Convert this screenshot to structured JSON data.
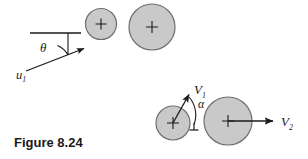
{
  "figure": {
    "caption": "Figure 8.24",
    "caption_position": {
      "x": 14,
      "y": 146
    },
    "background_color": "#ffffff",
    "stroke_color": "#1a1a1a",
    "body_fill_color": "#c9c9c9",
    "body_stroke_color": "#707070"
  },
  "diagrams": [
    {
      "id": "before-impact",
      "name": "before-impact-diagram",
      "bodies": [
        {
          "id": "small-ball-before",
          "name": "small-ball-before",
          "cx": 101,
          "cy": 24,
          "r": 15,
          "center_marker": "plus"
        },
        {
          "id": "large-ball-before",
          "name": "large-ball-before",
          "cx": 152,
          "cy": 27,
          "r": 23,
          "center_marker": "plus"
        }
      ],
      "reference_line": {
        "x1": 30,
        "y1": 33,
        "x2": 81,
        "y2": 33
      },
      "vectors": [
        {
          "id": "u1",
          "name": "velocity-vector-u1",
          "label": "u",
          "subscript": "1",
          "label_x": 18,
          "label_y": 78,
          "x1": 26,
          "y1": 71,
          "x2": 86,
          "y2": 48
        }
      ],
      "angles": [
        {
          "id": "theta",
          "name": "angle-theta",
          "label": "θ",
          "label_x": 40,
          "label_y": 51,
          "vertex_x": 68,
          "vertex_y": 33,
          "arc_d": "M 68 55 A 22 22 0 0 0 58.4 46.1"
        }
      ]
    },
    {
      "id": "after-impact",
      "name": "after-impact-diagram",
      "bodies": [
        {
          "id": "small-ball-after",
          "name": "small-ball-after",
          "cx": 173,
          "cy": 123,
          "r": 17,
          "center_marker": "plus"
        },
        {
          "id": "large-ball-after",
          "name": "large-ball-after",
          "cx": 228,
          "cy": 121,
          "r": 24,
          "center_marker": "plus"
        }
      ],
      "reference_tick": {
        "x1": 194,
        "y1": 112,
        "x2": 194,
        "y2": 126
      },
      "vectors": [
        {
          "id": "V1",
          "name": "velocity-vector-V1",
          "label": "V",
          "subscript": "1",
          "label_x": 197,
          "label_y": 91,
          "x1": 173,
          "y1": 123,
          "x2": 190,
          "y2": 93
        },
        {
          "id": "V2",
          "name": "velocity-vector-V2",
          "label": "V",
          "subscript": "2",
          "label_x": 285,
          "label_y": 129,
          "x1": 228,
          "y1": 121,
          "x2": 275,
          "y2": 121
        }
      ],
      "angles": [
        {
          "id": "alpha",
          "name": "angle-alpha",
          "label": "α",
          "label_x": 196,
          "label_y": 104,
          "vertex_x": 173,
          "vertex_y": 123,
          "arc_d": "M 190.5 95.5 A 26 26 0 0 1 194 125"
        }
      ]
    }
  ]
}
